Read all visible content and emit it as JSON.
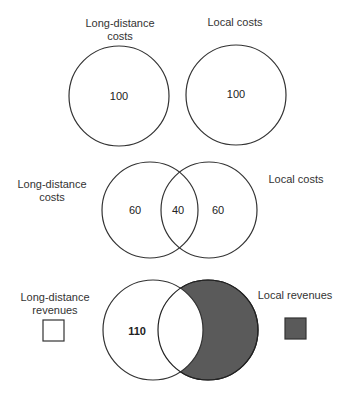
{
  "diagram": {
    "type": "venn",
    "colors": {
      "outline": "#333333",
      "shade": "#5a5a5a",
      "background": "#ffffff"
    },
    "panels": [
      {
        "id": "separate-costs",
        "circles": [
          {
            "label_lines": [
              "Long-distance",
              "costs"
            ],
            "value": "100"
          },
          {
            "label_lines": [
              "Local costs"
            ],
            "value": "100"
          }
        ]
      },
      {
        "id": "shared-costs",
        "left_label_lines": [
          "Long-distance",
          "costs"
        ],
        "right_label_lines": [
          "Local costs"
        ],
        "regions": {
          "left_only": "60",
          "overlap": "40",
          "right_only": "60"
        }
      },
      {
        "id": "revenues",
        "value": "110",
        "legend": [
          {
            "label_lines": [
              "Long-distance",
              "revenues"
            ],
            "swatch": "#ffffff"
          },
          {
            "label_lines": [
              "Local revenues"
            ],
            "swatch": "#5a5a5a"
          }
        ]
      }
    ]
  }
}
